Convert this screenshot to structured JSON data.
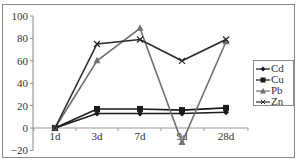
{
  "chart_data": {
    "type": "line",
    "title": "",
    "xlabel": "",
    "ylabel": "",
    "categories": [
      "1d",
      "3d",
      "7d",
      "9d",
      "28d"
    ],
    "ylim": [
      -20,
      100
    ],
    "yticks": [
      "100",
      "80",
      "60",
      "40",
      "20",
      "0",
      "-20"
    ],
    "grid": false,
    "legend_position": "right",
    "series": [
      {
        "name": "Cd",
        "marker": "diamond",
        "color": "#1a1a1a",
        "values": [
          0,
          13,
          13,
          13,
          14
        ]
      },
      {
        "name": "Cu",
        "marker": "square",
        "color": "#1a1a1a",
        "values": [
          0,
          17,
          17,
          16,
          18
        ]
      },
      {
        "name": "Pb",
        "marker": "triangle",
        "color": "#707070",
        "values": [
          0,
          60,
          89,
          -13,
          77
        ]
      },
      {
        "name": "Zn",
        "marker": "x",
        "color": "#2a2a2a",
        "values": [
          0,
          75,
          79,
          60,
          79
        ]
      }
    ]
  },
  "legend": {
    "items": [
      {
        "label": "Cd"
      },
      {
        "label": "Cu"
      },
      {
        "label": "Pb"
      },
      {
        "label": "Zn"
      }
    ]
  }
}
